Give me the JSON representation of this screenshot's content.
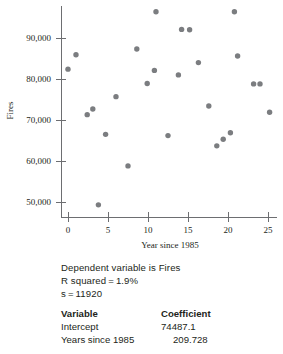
{
  "chart_data": {
    "type": "scatter",
    "title": "",
    "xlabel": "Year since 1985",
    "ylabel": "Fires",
    "xlim": [
      -1.5,
      26.5
    ],
    "ylim": [
      46000,
      98500
    ],
    "xticks": [
      0,
      5,
      10,
      15,
      20,
      25
    ],
    "xtick_labels": [
      "0",
      "5",
      "10",
      "15",
      "20",
      "25"
    ],
    "yticks": [
      50000,
      60000,
      70000,
      80000,
      90000
    ],
    "ytick_labels": [
      "50,000",
      "60,000",
      "70,000",
      "80,000",
      "90,000"
    ],
    "grid": false,
    "legend": "none",
    "marker_color": "#7b7d80",
    "points": [
      {
        "x": 0,
        "y": 82400
      },
      {
        "x": 1,
        "y": 85900
      },
      {
        "x": 2.4,
        "y": 71300
      },
      {
        "x": 3.1,
        "y": 72700
      },
      {
        "x": 3.8,
        "y": 49300
      },
      {
        "x": 4.7,
        "y": 66500
      },
      {
        "x": 6,
        "y": 75700
      },
      {
        "x": 7.5,
        "y": 58800
      },
      {
        "x": 8.6,
        "y": 87300
      },
      {
        "x": 9.9,
        "y": 78900
      },
      {
        "x": 10.8,
        "y": 82100
      },
      {
        "x": 11,
        "y": 96400
      },
      {
        "x": 12.5,
        "y": 66200
      },
      {
        "x": 13.8,
        "y": 81000
      },
      {
        "x": 14.2,
        "y": 92100
      },
      {
        "x": 15.2,
        "y": 92000
      },
      {
        "x": 16.3,
        "y": 84000
      },
      {
        "x": 17.6,
        "y": 73400
      },
      {
        "x": 18.6,
        "y": 63700
      },
      {
        "x": 19.4,
        "y": 65300
      },
      {
        "x": 20.3,
        "y": 66900
      },
      {
        "x": 20.8,
        "y": 96400
      },
      {
        "x": 21.2,
        "y": 85600
      },
      {
        "x": 23.2,
        "y": 78800
      },
      {
        "x": 24,
        "y": 78800
      },
      {
        "x": 25.2,
        "y": 71900
      }
    ]
  },
  "regression": {
    "dependent_line": "Dependent variable is Fires",
    "rsquared_label": "R squared",
    "rsquared_eq": "=",
    "rsquared_value": "1.9%",
    "s_label": "s",
    "s_eq": "=",
    "s_value": "11920",
    "table": {
      "headers": {
        "variable": "Variable",
        "coefficient": "Coefficient"
      },
      "rows": [
        {
          "variable": "Intercept",
          "coefficient": "74487.1"
        },
        {
          "variable": "Years since 1985",
          "coefficient": "209.728"
        }
      ]
    }
  }
}
